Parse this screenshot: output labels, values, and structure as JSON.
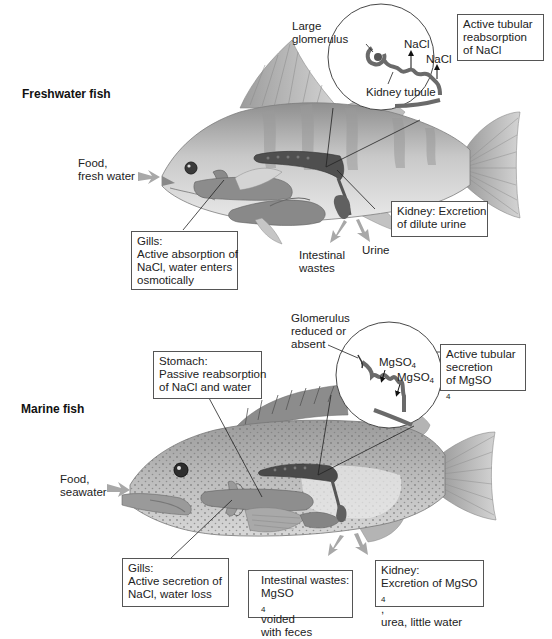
{
  "freshwater": {
    "title": "Freshwater fish",
    "food_label": [
      "Food,",
      "fresh water"
    ],
    "glomerulus_label": [
      "Large",
      "glomerulus"
    ],
    "inset_nacl_1": "NaCl",
    "inset_nacl_2": "NaCl",
    "kidney_tubule_label": "Kidney tubule",
    "tubular_box": [
      "Active tubular",
      "reabsorption",
      "of NaCl"
    ],
    "gills_box": [
      "Gills:",
      "Active absorption of",
      "NaCl, water enters",
      "osmotically"
    ],
    "kidney_box": [
      "Kidney: Excretion",
      "of dilute urine"
    ],
    "intestinal_label": [
      "Intestinal",
      "wastes"
    ],
    "urine_label": "Urine"
  },
  "marine": {
    "title": "Marine fish",
    "food_label": [
      "Food,",
      "seawater"
    ],
    "glomerulus_label": [
      "Glomerulus",
      "reduced or",
      "absent"
    ],
    "inset_mgso4_1": "MgSO",
    "inset_mgso4_2": "MgSO",
    "subscript": "4",
    "stomach_box": [
      "Stomach:",
      "Passive reabsorption",
      "of NaCl and water"
    ],
    "tubular_box": [
      "Active tubular",
      "secretion",
      "of MgSO"
    ],
    "gills_box": [
      "Gills:",
      "Active secretion of",
      "NaCl, water loss"
    ],
    "intestinal_box": [
      "Intestinal wastes:",
      "MgSO",
      " voided",
      "with feces"
    ],
    "kidney_box": [
      "Kidney:",
      "Excretion of MgSO",
      ",",
      "urea, little water"
    ]
  },
  "colors": {
    "fish_body": "#bdbdbd",
    "organ": "#7a7a7a",
    "kidney": "#555555",
    "arrow": "#a8a8a8",
    "box_border": "#555555"
  }
}
